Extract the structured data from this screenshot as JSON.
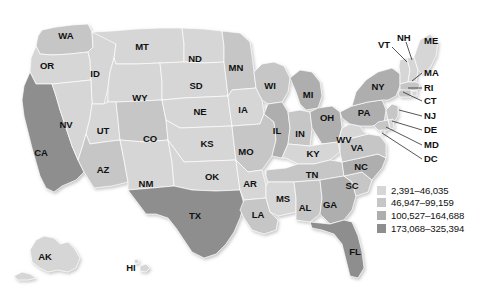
{
  "figure": {
    "background_color": "#ffffff"
  },
  "legend": {
    "name": "map-legend",
    "items": [
      {
        "label": "2,391–46,035",
        "color": "#d6d6d6",
        "tier": 1
      },
      {
        "label": "46,947–99,159",
        "color": "#c6c6c6",
        "tier": 2
      },
      {
        "label": "100,527–164,688",
        "color": "#aeaeae",
        "tier": 3
      },
      {
        "label": "173,068–325,394",
        "color": "#8e8e8e",
        "tier": 4
      }
    ]
  },
  "palette": {
    "tier1": "#d6d6d6",
    "tier2": "#c6c6c6",
    "tier3": "#aeaeae",
    "tier4": "#8e8e8e",
    "border": "#ffffff",
    "label": "#111111",
    "leader": "#2b2b2b"
  },
  "chart_data": {
    "type": "map",
    "title": "",
    "map_type": "choropleth",
    "region": "United States",
    "classes": [
      {
        "range": "2,391–46,035",
        "min": 2391,
        "max": 46035,
        "color": "#d6d6d6"
      },
      {
        "range": "46,947–99,159",
        "min": 46947,
        "max": 99159,
        "color": "#c6c6c6"
      },
      {
        "range": "100,527–164,688",
        "min": 100527,
        "max": 164688,
        "color": "#aeaeae"
      },
      {
        "range": "173,068–325,394",
        "min": 173068,
        "max": 325394,
        "color": "#8e8e8e"
      }
    ],
    "states": [
      {
        "code": "WA",
        "tier": 2
      },
      {
        "code": "OR",
        "tier": 1
      },
      {
        "code": "CA",
        "tier": 4
      },
      {
        "code": "ID",
        "tier": 1
      },
      {
        "code": "NV",
        "tier": 1
      },
      {
        "code": "MT",
        "tier": 1
      },
      {
        "code": "WY",
        "tier": 1
      },
      {
        "code": "UT",
        "tier": 1
      },
      {
        "code": "AZ",
        "tier": 2
      },
      {
        "code": "CO",
        "tier": 2
      },
      {
        "code": "NM",
        "tier": 1
      },
      {
        "code": "ND",
        "tier": 1
      },
      {
        "code": "SD",
        "tier": 1
      },
      {
        "code": "NE",
        "tier": 1
      },
      {
        "code": "KS",
        "tier": 1
      },
      {
        "code": "OK",
        "tier": 1
      },
      {
        "code": "TX",
        "tier": 4
      },
      {
        "code": "MN",
        "tier": 2
      },
      {
        "code": "IA",
        "tier": 1
      },
      {
        "code": "MO",
        "tier": 2
      },
      {
        "code": "AR",
        "tier": 1
      },
      {
        "code": "LA",
        "tier": 2
      },
      {
        "code": "WI",
        "tier": 2
      },
      {
        "code": "IL",
        "tier": 3
      },
      {
        "code": "MI",
        "tier": 3
      },
      {
        "code": "IN",
        "tier": 2
      },
      {
        "code": "OH",
        "tier": 3
      },
      {
        "code": "KY",
        "tier": 1
      },
      {
        "code": "TN",
        "tier": 2
      },
      {
        "code": "MS",
        "tier": 1
      },
      {
        "code": "AL",
        "tier": 2
      },
      {
        "code": "GA",
        "tier": 3
      },
      {
        "code": "FL",
        "tier": 4
      },
      {
        "code": "SC",
        "tier": 2
      },
      {
        "code": "NC",
        "tier": 3
      },
      {
        "code": "VA",
        "tier": 2
      },
      {
        "code": "WV",
        "tier": 1
      },
      {
        "code": "PA",
        "tier": 3
      },
      {
        "code": "NY",
        "tier": 3
      },
      {
        "code": "VT",
        "tier": 1
      },
      {
        "code": "NH",
        "tier": 1
      },
      {
        "code": "ME",
        "tier": 1
      },
      {
        "code": "MA",
        "tier": 2
      },
      {
        "code": "RI",
        "tier": 1
      },
      {
        "code": "CT",
        "tier": 2
      },
      {
        "code": "NJ",
        "tier": 2
      },
      {
        "code": "DE",
        "tier": 1
      },
      {
        "code": "MD",
        "tier": 2
      },
      {
        "code": "DC",
        "tier": 1
      },
      {
        "code": "AK",
        "tier": 1
      },
      {
        "code": "HI",
        "tier": 1
      }
    ]
  },
  "inline_labels": [
    {
      "code": "WA",
      "x": 66,
      "y": 36
    },
    {
      "code": "OR",
      "x": 47,
      "y": 66
    },
    {
      "code": "ID",
      "x": 95,
      "y": 74
    },
    {
      "code": "NV",
      "x": 66,
      "y": 125
    },
    {
      "code": "CA",
      "x": 41,
      "y": 153
    },
    {
      "code": "MT",
      "x": 142,
      "y": 47
    },
    {
      "code": "WY",
      "x": 140,
      "y": 98
    },
    {
      "code": "UT",
      "x": 103,
      "y": 131
    },
    {
      "code": "AZ",
      "x": 103,
      "y": 170
    },
    {
      "code": "CO",
      "x": 150,
      "y": 139
    },
    {
      "code": "NM",
      "x": 146,
      "y": 184
    },
    {
      "code": "ND",
      "x": 195,
      "y": 59
    },
    {
      "code": "SD",
      "x": 196,
      "y": 86
    },
    {
      "code": "NE",
      "x": 200,
      "y": 112
    },
    {
      "code": "KS",
      "x": 207,
      "y": 144
    },
    {
      "code": "OK",
      "x": 212,
      "y": 177
    },
    {
      "code": "TX",
      "x": 195,
      "y": 216
    },
    {
      "code": "MN",
      "x": 236,
      "y": 68
    },
    {
      "code": "IA",
      "x": 243,
      "y": 110
    },
    {
      "code": "MO",
      "x": 246,
      "y": 152
    },
    {
      "code": "AR",
      "x": 250,
      "y": 184
    },
    {
      "code": "LA",
      "x": 258,
      "y": 215
    },
    {
      "code": "MS",
      "x": 283,
      "y": 199
    },
    {
      "code": "AL",
      "x": 305,
      "y": 208
    },
    {
      "code": "WI",
      "x": 270,
      "y": 86
    },
    {
      "code": "IL",
      "x": 277,
      "y": 131
    },
    {
      "code": "IN",
      "x": 300,
      "y": 134
    },
    {
      "code": "MI",
      "x": 308,
      "y": 95
    },
    {
      "code": "OH",
      "x": 327,
      "y": 118
    },
    {
      "code": "KY",
      "x": 313,
      "y": 154
    },
    {
      "code": "TN",
      "x": 312,
      "y": 175
    },
    {
      "code": "GA",
      "x": 330,
      "y": 205
    },
    {
      "code": "FL",
      "x": 355,
      "y": 252
    },
    {
      "code": "SC",
      "x": 352,
      "y": 186
    },
    {
      "code": "NC",
      "x": 361,
      "y": 167
    },
    {
      "code": "VA",
      "x": 357,
      "y": 148
    },
    {
      "code": "WV",
      "x": 344,
      "y": 140
    },
    {
      "code": "PA",
      "x": 364,
      "y": 113
    },
    {
      "code": "NY",
      "x": 378,
      "y": 87
    },
    {
      "code": "AK",
      "x": 45,
      "y": 257
    },
    {
      "code": "HI",
      "x": 131,
      "y": 268
    }
  ],
  "callouts": [
    {
      "code": "VT",
      "text_x": 378,
      "text_y": 45,
      "lx1": 392,
      "ly1": 47,
      "lx2": 407,
      "ly2": 62
    },
    {
      "code": "NH",
      "text_x": 397,
      "text_y": 38,
      "lx1": 406,
      "ly1": 42,
      "lx2": 412,
      "ly2": 60
    },
    {
      "code": "ME",
      "text_x": 424,
      "text_y": 41,
      "lx1": 0,
      "ly1": 0,
      "lx2": 0,
      "ly2": 0
    },
    {
      "code": "MA",
      "text_x": 424,
      "text_y": 73,
      "lx1": 422,
      "ly1": 73,
      "lx2": 412,
      "ly2": 81
    },
    {
      "code": "RI",
      "text_x": 424,
      "text_y": 88,
      "lx1": 422,
      "ly1": 88,
      "lx2": 408,
      "ly2": 88
    },
    {
      "code": "CT",
      "text_x": 424,
      "text_y": 101,
      "lx1": 422,
      "ly1": 101,
      "lx2": 403,
      "ly2": 92
    },
    {
      "code": "NJ",
      "text_x": 424,
      "text_y": 116,
      "lx1": 422,
      "ly1": 116,
      "lx2": 399,
      "ly2": 110
    },
    {
      "code": "DE",
      "text_x": 424,
      "text_y": 130,
      "lx1": 422,
      "ly1": 130,
      "lx2": 392,
      "ly2": 121
    },
    {
      "code": "MD",
      "text_x": 424,
      "text_y": 145,
      "lx1": 422,
      "ly1": 145,
      "lx2": 386,
      "ly2": 127
    },
    {
      "code": "DC",
      "text_x": 424,
      "text_y": 159,
      "lx1": 422,
      "ly1": 159,
      "lx2": 382,
      "ly2": 133
    }
  ]
}
